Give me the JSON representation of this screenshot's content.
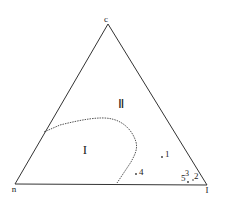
{
  "diagram": {
    "type": "ternary",
    "vertices": {
      "top": {
        "label": "c",
        "x": 108,
        "y": 22
      },
      "left": {
        "label": "n",
        "x": 15,
        "y": 183
      },
      "right": {
        "label": "I",
        "x": 207,
        "y": 184
      }
    },
    "regions": [
      {
        "label": "I",
        "x": 85,
        "y": 152
      },
      {
        "label": "Ⅱ",
        "x": 121,
        "y": 106
      }
    ],
    "boundary": {
      "style": "dotted",
      "path": "M44,132 L60,125 C80,120 100,116 112,119 C125,122 133,132 136,142 C138,150 134,156 131,162 L117,183"
    },
    "points": [
      {
        "label": "1",
        "mx": 162,
        "my": 157,
        "tx": 165,
        "ty": 157
      },
      {
        "label": "4",
        "mx": 136,
        "my": 174,
        "tx": 139,
        "ty": 174
      },
      {
        "label": "5",
        "mx": 0,
        "my": 0,
        "tx": 181,
        "ty": 180
      },
      {
        "label": "3",
        "mx": 188,
        "my": 182,
        "tx": 186,
        "ty": 176
      },
      {
        "label": "2",
        "mx": 0,
        "my": 0,
        "tx": 195,
        "ty": 178
      }
    ],
    "colors": {
      "line": "#333333",
      "boundary": "#555555",
      "text": "#222222"
    }
  }
}
